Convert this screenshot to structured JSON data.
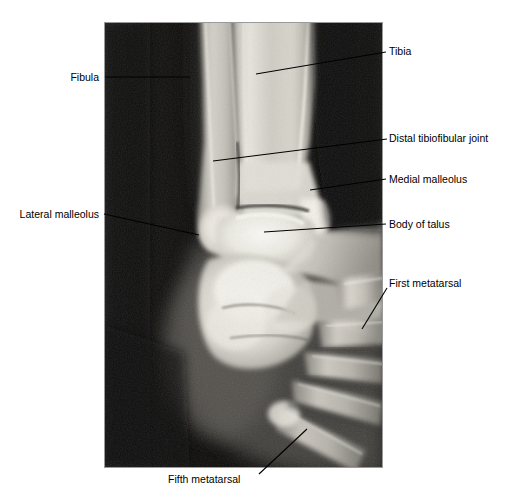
{
  "figure": {
    "type": "radiograph",
    "view": "ankle-anteroposterior-oblique",
    "background_color": "#ffffff",
    "plate": {
      "left": 104,
      "top": 22,
      "width": 279,
      "height": 446,
      "border_color": "#8a8a8a",
      "dark_field_color": "#111111",
      "bone_bright_color": "#f2f2ee",
      "soft_tissue_color": "#6e6e6a"
    },
    "leader_line_color": "#000000"
  },
  "annotations": [
    {
      "id": "tibia",
      "label": "Tibia",
      "side": "right",
      "text_x": 389,
      "text_y": 45,
      "line": {
        "x1": 256,
        "y1": 74,
        "x2": 386,
        "y2": 52
      }
    },
    {
      "id": "distal-tibiofibular-joint",
      "label": "Distal tibiofibular joint",
      "side": "right",
      "text_x": 389,
      "text_y": 132,
      "line": {
        "x1": 213,
        "y1": 161,
        "x2": 387,
        "y2": 139
      }
    },
    {
      "id": "medial-malleolus",
      "label": "Medial malleolus",
      "side": "right",
      "text_x": 389,
      "text_y": 173,
      "line": {
        "x1": 310,
        "y1": 190,
        "x2": 386,
        "y2": 179
      }
    },
    {
      "id": "body-of-talus",
      "label": "Body of talus",
      "side": "right",
      "text_x": 389,
      "text_y": 218,
      "line": {
        "x1": 264,
        "y1": 232,
        "x2": 386,
        "y2": 224
      }
    },
    {
      "id": "first-metatarsal",
      "label": "First metatarsal",
      "side": "right",
      "text_x": 389,
      "text_y": 277,
      "line": {
        "x1": 362,
        "y1": 329,
        "x2": 387,
        "y2": 288
      }
    },
    {
      "id": "fibula",
      "label": "Fibula",
      "side": "left",
      "text_x": 100,
      "text_y": 71,
      "line": {
        "x1": 105,
        "y1": 77,
        "x2": 190,
        "y2": 77
      }
    },
    {
      "id": "lateral-malleolus",
      "label": "Lateral malleolus",
      "side": "left",
      "text_x": 100,
      "text_y": 208,
      "line": {
        "x1": 104,
        "y1": 214,
        "x2": 199,
        "y2": 235
      }
    },
    {
      "id": "fifth-metatarsal",
      "label": "Fifth metatarsal",
      "side": "bottom",
      "text_x": 168,
      "text_y": 473,
      "line": {
        "x1": 259,
        "y1": 474,
        "x2": 307,
        "y2": 429
      }
    }
  ]
}
